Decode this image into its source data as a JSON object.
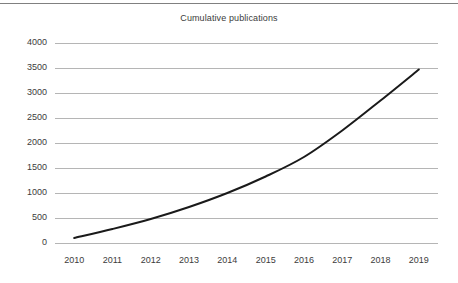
{
  "figure": {
    "background_color": "#ffffff",
    "top_rule_color": "#808080"
  },
  "chart_data": {
    "type": "line",
    "title": "Cumulative publications",
    "xlabel": "",
    "ylabel": "",
    "categories": [
      "2010",
      "2011",
      "2012",
      "2013",
      "2014",
      "2015",
      "2016",
      "2017",
      "2018",
      "2019"
    ],
    "x": [
      2010,
      2011,
      2012,
      2013,
      2014,
      2015,
      2016,
      2017,
      2018,
      2019
    ],
    "values": [
      100,
      280,
      480,
      720,
      1000,
      1330,
      1720,
      2250,
      2850,
      3470
    ],
    "series": [
      {
        "name": "Cumulative publications",
        "values": [
          100,
          280,
          480,
          720,
          1000,
          1330,
          1720,
          2250,
          2850,
          3470
        ],
        "color": "#1a1a1a",
        "line_width": 2,
        "markers": false,
        "smooth": true
      }
    ],
    "ylim": [
      0,
      4000
    ],
    "yticks": [
      0,
      500,
      1000,
      1500,
      2000,
      2500,
      3000,
      3500,
      4000
    ],
    "ytick_labels": [
      "0",
      "500",
      "1000",
      "1500",
      "2000",
      "2500",
      "3000",
      "3500",
      "4000"
    ],
    "xtick_labels": [
      "2010",
      "2011",
      "2012",
      "2013",
      "2014",
      "2015",
      "2016",
      "2017",
      "2018",
      "2019"
    ],
    "grid": {
      "horizontal": true,
      "vertical": false,
      "color": "#b5b5b5"
    },
    "legend": {
      "visible": false,
      "position": "none"
    },
    "axis_line_color": "#b5b5b5",
    "text_color": "#3c3c3c"
  }
}
